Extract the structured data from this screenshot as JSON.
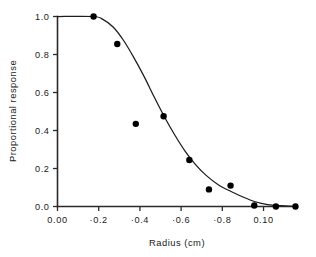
{
  "chart_data": {
    "type": "scatter",
    "title": "",
    "subtitle": "",
    "xlabel": "Radius  (cm)",
    "ylabel": "Proportional response",
    "xlim": [
      0.0,
      1.16
    ],
    "ylim": [
      0.0,
      1.0
    ],
    "grid": false,
    "legend": null,
    "x_tick_labels": [
      "0.00",
      "·0.2",
      "·0.4",
      "·0.6",
      "·0.8",
      "0.10"
    ],
    "x_tick_values": [
      0.0,
      0.2,
      0.4,
      0.6,
      0.8,
      1.0
    ],
    "y_tick_labels": [
      "0.0",
      "0.2",
      "0.4",
      "0.6",
      "0.8",
      "1.0"
    ],
    "y_tick_values": [
      0.0,
      0.2,
      0.4,
      0.6,
      0.8,
      1.0
    ],
    "series": [
      {
        "name": "observed",
        "type": "scatter",
        "marker": "filled-circle",
        "color": "#000000",
        "points": [
          {
            "x": 0.175,
            "y": 1.0
          },
          {
            "x": 0.29,
            "y": 0.855
          },
          {
            "x": 0.38,
            "y": 0.435
          },
          {
            "x": 0.515,
            "y": 0.475
          },
          {
            "x": 0.64,
            "y": 0.245
          },
          {
            "x": 0.735,
            "y": 0.09
          },
          {
            "x": 0.84,
            "y": 0.11
          },
          {
            "x": 0.955,
            "y": 0.005
          },
          {
            "x": 1.06,
            "y": 0.0
          },
          {
            "x": 1.155,
            "y": 0.0
          }
        ]
      },
      {
        "name": "fitted curve",
        "type": "line",
        "color": "#1c1c1c",
        "points": [
          {
            "x": 0.0,
            "y": 1.0
          },
          {
            "x": 0.175,
            "y": 1.0
          },
          {
            "x": 0.22,
            "y": 0.985
          },
          {
            "x": 0.27,
            "y": 0.945
          },
          {
            "x": 0.32,
            "y": 0.875
          },
          {
            "x": 0.37,
            "y": 0.785
          },
          {
            "x": 0.42,
            "y": 0.685
          },
          {
            "x": 0.47,
            "y": 0.575
          },
          {
            "x": 0.52,
            "y": 0.47
          },
          {
            "x": 0.57,
            "y": 0.375
          },
          {
            "x": 0.62,
            "y": 0.29
          },
          {
            "x": 0.67,
            "y": 0.22
          },
          {
            "x": 0.72,
            "y": 0.165
          },
          {
            "x": 0.78,
            "y": 0.115
          },
          {
            "x": 0.84,
            "y": 0.08
          },
          {
            "x": 0.9,
            "y": 0.05
          },
          {
            "x": 0.96,
            "y": 0.025
          },
          {
            "x": 1.02,
            "y": 0.01
          },
          {
            "x": 1.08,
            "y": 0.004
          },
          {
            "x": 1.16,
            "y": 0.0
          }
        ]
      }
    ]
  },
  "axis_titles": {
    "x": "Radius  (cm)",
    "y": "Proportional response"
  }
}
